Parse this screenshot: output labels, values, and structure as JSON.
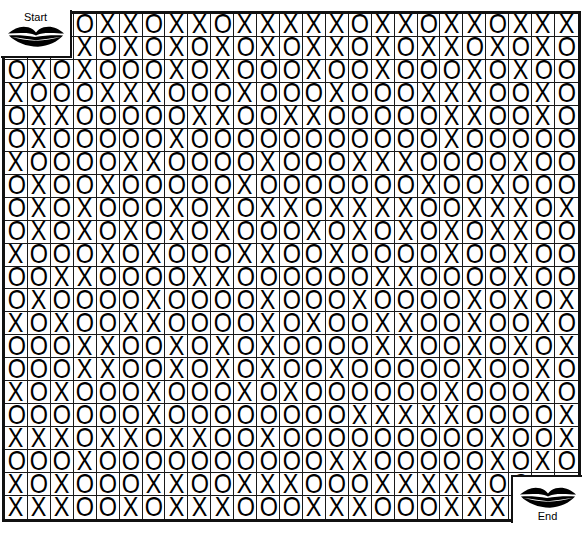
{
  "page": {
    "top_caption": "",
    "background_color": "#ffffff",
    "ink_color": "#000000"
  },
  "puzzle": {
    "type": "maze",
    "title": "",
    "columns": 25,
    "rows": 22,
    "start": {
      "label": "Start",
      "icon": "lips-icon",
      "col_span": 3,
      "row_span": 2,
      "position": "top-left"
    },
    "end": {
      "label": "End",
      "icon": "lips-icon",
      "col_span": 3,
      "row_span": 2,
      "position": "bottom-right"
    },
    "symbols": [
      "O",
      "X"
    ],
    "grid": [
      [
        "",
        "",
        "",
        "O",
        "X",
        "X",
        "O",
        "X",
        "X",
        "O",
        "X",
        "X",
        "X",
        "X",
        "X",
        "O",
        "X",
        "X",
        "O",
        "X",
        "X",
        "O",
        "X",
        "X",
        "X"
      ],
      [
        "",
        "",
        "",
        "X",
        "O",
        "X",
        "O",
        "X",
        "O",
        "X",
        "O",
        "X",
        "O",
        "X",
        "X",
        "O",
        "X",
        "O",
        "X",
        "X",
        "O",
        "X",
        "O",
        "X",
        "O"
      ],
      [
        "O",
        "X",
        "O",
        "X",
        "O",
        "O",
        "O",
        "X",
        "O",
        "X",
        "O",
        "O",
        "O",
        "X",
        "O",
        "O",
        "X",
        "O",
        "O",
        "O",
        "X",
        "O",
        "X",
        "O",
        "O"
      ],
      [
        "X",
        "O",
        "O",
        "O",
        "X",
        "X",
        "X",
        "O",
        "O",
        "O",
        "X",
        "O",
        "O",
        "O",
        "X",
        "O",
        "O",
        "O",
        "X",
        "X",
        "X",
        "O",
        "O",
        "X",
        "O"
      ],
      [
        "O",
        "X",
        "X",
        "O",
        "O",
        "O",
        "O",
        "O",
        "X",
        "X",
        "O",
        "O",
        "X",
        "X",
        "O",
        "O",
        "O",
        "O",
        "O",
        "X",
        "X",
        "O",
        "O",
        "X",
        "O"
      ],
      [
        "O",
        "X",
        "O",
        "O",
        "O",
        "O",
        "O",
        "X",
        "O",
        "O",
        "O",
        "O",
        "O",
        "O",
        "O",
        "O",
        "O",
        "O",
        "O",
        "X",
        "O",
        "O",
        "O",
        "O",
        "O"
      ],
      [
        "X",
        "O",
        "O",
        "O",
        "O",
        "X",
        "X",
        "O",
        "O",
        "O",
        "O",
        "X",
        "O",
        "O",
        "O",
        "X",
        "X",
        "X",
        "O",
        "O",
        "O",
        "O",
        "X",
        "O",
        "O"
      ],
      [
        "O",
        "X",
        "O",
        "O",
        "X",
        "O",
        "O",
        "O",
        "O",
        "O",
        "X",
        "O",
        "O",
        "O",
        "O",
        "O",
        "O",
        "O",
        "X",
        "O",
        "O",
        "X",
        "O",
        "O",
        "O"
      ],
      [
        "O",
        "X",
        "O",
        "X",
        "O",
        "O",
        "O",
        "X",
        "O",
        "X",
        "O",
        "X",
        "X",
        "O",
        "X",
        "X",
        "X",
        "X",
        "O",
        "O",
        "X",
        "X",
        "X",
        "O",
        "X"
      ],
      [
        "O",
        "X",
        "O",
        "X",
        "O",
        "X",
        "O",
        "X",
        "O",
        "X",
        "O",
        "O",
        "O",
        "X",
        "O",
        "X",
        "O",
        "X",
        "O",
        "X",
        "O",
        "X",
        "X",
        "O",
        "O"
      ],
      [
        "X",
        "O",
        "O",
        "O",
        "X",
        "O",
        "X",
        "O",
        "O",
        "O",
        "X",
        "X",
        "O",
        "O",
        "X",
        "O",
        "O",
        "O",
        "O",
        "X",
        "O",
        "O",
        "X",
        "O",
        "O"
      ],
      [
        "O",
        "O",
        "X",
        "X",
        "O",
        "O",
        "O",
        "O",
        "X",
        "X",
        "O",
        "O",
        "O",
        "O",
        "O",
        "O",
        "X",
        "X",
        "O",
        "O",
        "O",
        "O",
        "X",
        "O",
        "O"
      ],
      [
        "O",
        "X",
        "O",
        "O",
        "O",
        "O",
        "X",
        "O",
        "O",
        "O",
        "O",
        "X",
        "O",
        "O",
        "O",
        "X",
        "O",
        "O",
        "O",
        "O",
        "X",
        "O",
        "X",
        "O",
        "X"
      ],
      [
        "X",
        "O",
        "X",
        "O",
        "O",
        "X",
        "X",
        "O",
        "O",
        "O",
        "O",
        "X",
        "O",
        "X",
        "O",
        "O",
        "X",
        "X",
        "O",
        "O",
        "X",
        "O",
        "O",
        "X",
        "O"
      ],
      [
        "O",
        "O",
        "O",
        "X",
        "X",
        "O",
        "O",
        "X",
        "O",
        "X",
        "O",
        "X",
        "O",
        "O",
        "O",
        "O",
        "X",
        "X",
        "O",
        "O",
        "X",
        "O",
        "X",
        "O",
        "X"
      ],
      [
        "O",
        "O",
        "O",
        "X",
        "X",
        "O",
        "O",
        "X",
        "O",
        "X",
        "O",
        "X",
        "O",
        "O",
        "X",
        "O",
        "O",
        "O",
        "O",
        "O",
        "X",
        "O",
        "O",
        "X",
        "O"
      ],
      [
        "X",
        "O",
        "X",
        "O",
        "O",
        "O",
        "X",
        "O",
        "O",
        "O",
        "X",
        "O",
        "X",
        "O",
        "O",
        "O",
        "O",
        "O",
        "O",
        "X",
        "O",
        "O",
        "O",
        "X",
        "O"
      ],
      [
        "O",
        "O",
        "O",
        "O",
        "O",
        "O",
        "X",
        "O",
        "O",
        "O",
        "O",
        "O",
        "O",
        "O",
        "O",
        "X",
        "X",
        "X",
        "X",
        "X",
        "O",
        "O",
        "O",
        "O",
        "X"
      ],
      [
        "X",
        "X",
        "X",
        "O",
        "X",
        "X",
        "O",
        "X",
        "X",
        "O",
        "O",
        "X",
        "O",
        "O",
        "O",
        "O",
        "O",
        "O",
        "O",
        "O",
        "O",
        "X",
        "O",
        "O",
        "X"
      ],
      [
        "O",
        "O",
        "O",
        "X",
        "O",
        "O",
        "O",
        "O",
        "O",
        "O",
        "O",
        "O",
        "O",
        "O",
        "X",
        "X",
        "O",
        "O",
        "O",
        "O",
        "O",
        "X",
        "O",
        "X",
        "O"
      ],
      [
        "X",
        "O",
        "X",
        "O",
        "O",
        "O",
        "X",
        "X",
        "O",
        "O",
        "X",
        "X",
        "X",
        "O",
        "O",
        "O",
        "X",
        "X",
        "X",
        "X",
        "X",
        "O",
        "O",
        "",
        ""
      ],
      [
        "X",
        "X",
        "X",
        "O",
        "O",
        "X",
        "O",
        "X",
        "X",
        "X",
        "O",
        "O",
        "O",
        "X",
        "X",
        "X",
        "O",
        "O",
        "O",
        "X",
        "X",
        "X",
        "",
        "",
        ""
      ]
    ]
  }
}
